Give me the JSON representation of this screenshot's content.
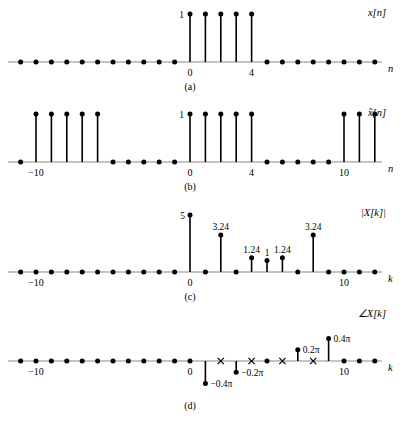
{
  "figure": {
    "panels": [
      {
        "id": "a",
        "letter": "(a)",
        "signal_label": "x[n]",
        "axis_label": "n",
        "tick_labels": [
          "0",
          "4"
        ],
        "ticks": [
          0,
          4
        ],
        "value_labels": [
          {
            "k": 0,
            "text": "1"
          }
        ]
      },
      {
        "id": "b",
        "letter": "(b)",
        "signal_label": "x̃[n]",
        "axis_label": "n",
        "tick_labels": [
          "−10",
          "0",
          "4",
          "10"
        ],
        "ticks": [
          -10,
          0,
          4,
          10
        ],
        "value_labels": [
          {
            "k": 0,
            "text": "1"
          }
        ]
      },
      {
        "id": "c",
        "letter": "(c)",
        "signal_label": "|X[k]|",
        "axis_label": "k",
        "tick_labels": [
          "−10",
          "0",
          "10"
        ],
        "ticks": [
          -10,
          0,
          10
        ],
        "value_labels": [
          {
            "k": 0,
            "text": "5"
          },
          {
            "k": 2,
            "text": "3.24"
          },
          {
            "k": 4,
            "text": "1.24"
          },
          {
            "k": 5,
            "text": "1"
          },
          {
            "k": 6,
            "text": "1.24"
          },
          {
            "k": 8,
            "text": "3.24"
          }
        ]
      },
      {
        "id": "d",
        "letter": "(d)",
        "signal_label": "∠X[k]",
        "axis_label": "k",
        "tick_labels": [
          "−10",
          "0",
          "10"
        ],
        "ticks": [
          -10,
          0,
          10
        ],
        "value_labels": [
          {
            "k": 1,
            "text": "−0.4π"
          },
          {
            "k": 3,
            "text": "−0.2π"
          },
          {
            "k": 7,
            "text": "0.2π"
          },
          {
            "k": 9,
            "text": "0.4π"
          }
        ]
      }
    ]
  },
  "chart_data": [
    {
      "type": "stem",
      "id": "a",
      "title": "x[n]",
      "xlabel": "n",
      "ylabel": "x[n]",
      "xlim": [
        -13,
        13
      ],
      "ylim": [
        0,
        1.15
      ],
      "x": [
        -13,
        -12,
        -11,
        -10,
        -9,
        -8,
        -7,
        -6,
        -5,
        -4,
        -3,
        -2,
        -1,
        0,
        1,
        2,
        3,
        4,
        5,
        6,
        7,
        8,
        9,
        10,
        11,
        12,
        13
      ],
      "values": [
        0,
        0,
        0,
        0,
        0,
        0,
        0,
        0,
        0,
        0,
        0,
        0,
        0,
        1,
        1,
        1,
        1,
        1,
        0,
        0,
        0,
        0,
        0,
        0,
        0,
        0,
        0
      ],
      "annotations": [
        {
          "x": 0,
          "y": 1,
          "text": "1"
        }
      ],
      "xticks": [
        0,
        4
      ],
      "xticklabels": [
        "0",
        "4"
      ],
      "grid": false,
      "legend": false
    },
    {
      "type": "stem",
      "id": "b",
      "title": "x̃[n]",
      "xlabel": "n",
      "ylabel": "x̃[n]",
      "xlim": [
        -13,
        13
      ],
      "ylim": [
        0,
        1.15
      ],
      "period": 10,
      "x": [
        -13,
        -12,
        -11,
        -10,
        -9,
        -8,
        -7,
        -6,
        -5,
        -4,
        -3,
        -2,
        -1,
        0,
        1,
        2,
        3,
        4,
        5,
        6,
        7,
        8,
        9,
        10,
        11,
        12,
        13
      ],
      "values": [
        0,
        0,
        0,
        1,
        1,
        1,
        1,
        1,
        0,
        0,
        0,
        0,
        0,
        1,
        1,
        1,
        1,
        1,
        0,
        0,
        0,
        0,
        0,
        1,
        1,
        1,
        0
      ],
      "annotations": [
        {
          "x": 0,
          "y": 1,
          "text": "1"
        }
      ],
      "xticks": [
        -10,
        0,
        4,
        10
      ],
      "xticklabels": [
        "−10",
        "0",
        "4",
        "10"
      ],
      "grid": false,
      "legend": false
    },
    {
      "type": "stem",
      "id": "c",
      "title": "|X[k]|",
      "xlabel": "k",
      "ylabel": "|X[k]|",
      "xlim": [
        -13,
        13
      ],
      "ylim": [
        0,
        5.4
      ],
      "x": [
        -13,
        -12,
        -11,
        -10,
        -9,
        -8,
        -7,
        -6,
        -5,
        -4,
        -3,
        -2,
        -1,
        0,
        1,
        2,
        3,
        4,
        5,
        6,
        7,
        8,
        9,
        10,
        11,
        12,
        13
      ],
      "values": [
        0,
        0,
        0,
        0,
        0,
        0,
        0,
        0,
        0,
        0,
        0,
        0,
        0,
        5,
        0,
        3.24,
        0,
        1.24,
        1,
        1.24,
        0,
        3.24,
        0,
        0,
        0,
        0,
        0
      ],
      "annotations": [
        {
          "x": 0,
          "y": 5,
          "text": "5"
        },
        {
          "x": 2,
          "y": 3.24,
          "text": "3.24"
        },
        {
          "x": 4,
          "y": 1.24,
          "text": "1.24"
        },
        {
          "x": 5,
          "y": 1,
          "text": "1"
        },
        {
          "x": 6,
          "y": 1.24,
          "text": "1.24"
        },
        {
          "x": 8,
          "y": 3.24,
          "text": "3.24"
        }
      ],
      "xticks": [
        -10,
        0,
        10
      ],
      "xticklabels": [
        "−10",
        "0",
        "10"
      ],
      "grid": false,
      "legend": false
    },
    {
      "type": "stem",
      "id": "d",
      "title": "∠X[k]",
      "xlabel": "k",
      "ylabel": "∠X[k]",
      "xlim": [
        -13,
        13
      ],
      "ylim": [
        -0.5,
        0.5
      ],
      "unit": "pi radians",
      "x": [
        -13,
        -12,
        -11,
        -10,
        -9,
        -8,
        -7,
        -6,
        -5,
        -4,
        -3,
        -2,
        -1,
        0,
        1,
        2,
        3,
        4,
        5,
        6,
        7,
        8,
        9,
        10,
        11,
        12,
        13
      ],
      "values": [
        0,
        0,
        0,
        0,
        0,
        0,
        0,
        0,
        0,
        0,
        0,
        0,
        0,
        0,
        -0.4,
        0,
        -0.2,
        0,
        0,
        0,
        0.2,
        0,
        0.4,
        0,
        0,
        0,
        0
      ],
      "undefined_markers": [
        2,
        4,
        6,
        8
      ],
      "annotations": [
        {
          "x": 1,
          "y": -0.4,
          "text": "−0.4π"
        },
        {
          "x": 3,
          "y": -0.2,
          "text": "−0.2π"
        },
        {
          "x": 7,
          "y": 0.2,
          "text": "0.2π"
        },
        {
          "x": 9,
          "y": 0.4,
          "text": "0.4π"
        }
      ],
      "xticks": [
        -10,
        0,
        10
      ],
      "xticklabels": [
        "−10",
        "0",
        "10"
      ],
      "grid": false,
      "legend": false
    }
  ]
}
